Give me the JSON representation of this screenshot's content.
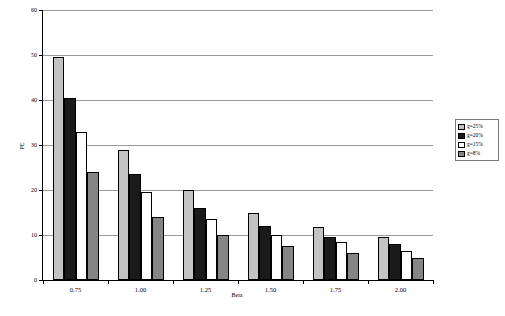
{
  "chart_data": {
    "type": "bar",
    "title": "",
    "xlabel": "Beta",
    "ylabel": "PE",
    "categories": [
      "0.75",
      "1.00",
      "1.25",
      "1.50",
      "1.75",
      "2.00"
    ],
    "series": [
      {
        "name": "g=25%",
        "color": "#c3c3c3",
        "values": [
          49.5,
          29.0,
          20.0,
          15.0,
          11.8,
          9.5
        ]
      },
      {
        "name": "g=20%",
        "color": "#1a1a1a",
        "values": [
          40.5,
          23.5,
          16.0,
          12.0,
          9.5,
          8.0
        ]
      },
      {
        "name": "g=15%",
        "color": "#ffffff",
        "values": [
          33.0,
          19.5,
          13.5,
          10.0,
          8.5,
          6.5
        ]
      },
      {
        "name": "g=8%",
        "color": "#858585",
        "values": [
          24.0,
          14.0,
          10.0,
          7.5,
          6.0,
          5.0
        ]
      }
    ],
    "ylim": [
      0,
      60
    ],
    "yticks": [
      0,
      10,
      20,
      30,
      40,
      50,
      60
    ],
    "ytick_labels": [
      "0",
      "10",
      "20",
      "30",
      "40",
      "50",
      "60"
    ],
    "grid": true,
    "legend_position": "right"
  }
}
